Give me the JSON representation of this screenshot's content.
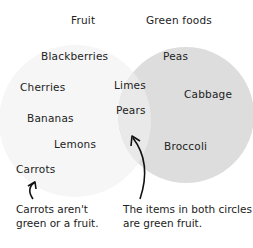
{
  "diagram": {
    "type": "venn",
    "sets": [
      {
        "name": "Fruit",
        "fill": "#f5f5f5"
      },
      {
        "name": "Green foods",
        "fill": "#dedede"
      }
    ],
    "overlap_fill": "#e9e9e9",
    "fruit_only": [
      "Blackberries",
      "Cherries",
      "Bananas",
      "Lemons"
    ],
    "green_only": [
      "Peas",
      "Cabbage",
      "Broccoli"
    ],
    "both": [
      "Limes",
      "Pears"
    ],
    "neither": [
      "Carrots"
    ],
    "annotations": {
      "carrots_note_line1": "Carrots aren't",
      "carrots_note_line2": "green or a fruit.",
      "both_note_line1": "The items in both circles",
      "both_note_line2": "are green fruit."
    }
  }
}
